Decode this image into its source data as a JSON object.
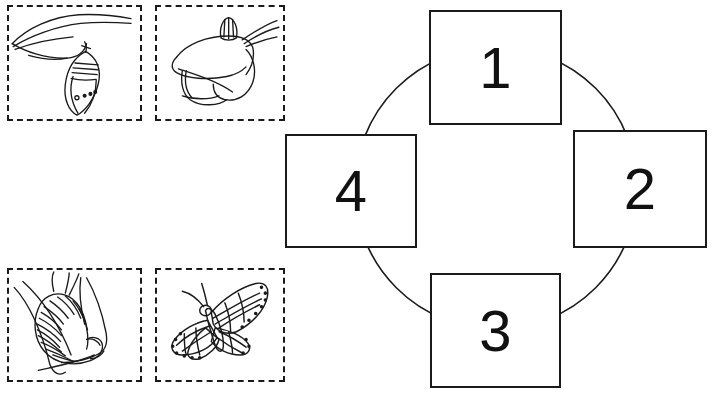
{
  "worksheet": {
    "title": "Butterfly life cycle cut-and-paste worksheet",
    "ink_color": "#1a1a1a",
    "background_color": "#ffffff",
    "width": 715,
    "height": 402
  },
  "cutouts": {
    "label": "Cut-out picture cards",
    "items": [
      {
        "id": "chrysalis",
        "icon": "chrysalis-icon",
        "caption": ""
      },
      {
        "id": "egg",
        "icon": "egg-on-leaf-icon",
        "caption": ""
      },
      {
        "id": "larva",
        "icon": "caterpillar-icon",
        "caption": ""
      },
      {
        "id": "butterfly",
        "icon": "butterfly-icon",
        "caption": ""
      }
    ]
  },
  "cycle": {
    "label": "Life cycle order diagram",
    "ring_shape": "circle",
    "boxes": [
      {
        "position": "top",
        "number": "1"
      },
      {
        "position": "right",
        "number": "2"
      },
      {
        "position": "bottom",
        "number": "3"
      },
      {
        "position": "left",
        "number": "4"
      }
    ]
  }
}
